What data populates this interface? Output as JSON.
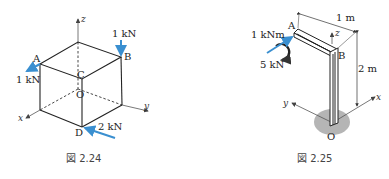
{
  "figures": [
    {
      "caption": "図 2.24",
      "description": "Cube with forces at vertices",
      "axes": {
        "x": "x",
        "y": "y",
        "z": "z"
      },
      "points": {
        "A": "A",
        "B": "B",
        "C": "C",
        "D": "D",
        "O": "O"
      },
      "forces": [
        {
          "point": "A",
          "label": "1 kN"
        },
        {
          "point": "B",
          "label": "1 kN"
        },
        {
          "point": "D",
          "label": "2 kN"
        }
      ]
    },
    {
      "caption": "図 2.25",
      "description": "L-shaped bar fixed at O",
      "axes": {
        "x": "x",
        "y": "y",
        "z": "z"
      },
      "points": {
        "A": "A",
        "B": "B",
        "O": "O"
      },
      "loads": {
        "moment": "1 kNm",
        "force": "5 kN"
      },
      "dimensions": {
        "horizontal": "1 m",
        "vertical": "2 m"
      }
    }
  ],
  "colors": {
    "force_arrow": "#3a8fd0",
    "line": "#222222",
    "support": "#b5b5b5"
  }
}
